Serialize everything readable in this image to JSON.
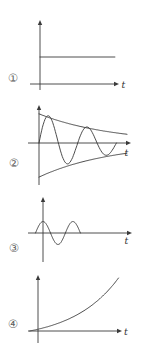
{
  "figure": {
    "background": "#ffffff",
    "stroke": "#3a3a3a",
    "number_color": "#5f5f5f",
    "panel_count": 4
  },
  "chart_data": [
    {
      "type": "line",
      "panel_label": "①",
      "xlabel": "t",
      "description": "constant steady value above the time axis",
      "x_range": [
        0,
        1
      ],
      "y_range": [
        -1.3,
        1.3
      ],
      "grid": false,
      "series": [
        {
          "name": "constant",
          "form": "points",
          "points": [
            [
              0,
              0.964
            ],
            [
              0.96,
              0.964
            ]
          ]
        }
      ]
    },
    {
      "type": "line",
      "panel_label": "②",
      "xlabel": "t",
      "description": "damped oscillation bounded by exponential decay envelopes",
      "x_range": [
        0,
        1
      ],
      "y_range": [
        -1.3,
        1.3
      ],
      "grid": false,
      "series": [
        {
          "name": "damped-sine",
          "form": "damped_sine",
          "amplitude": 1.0,
          "tau": 0.83,
          "period": 0.44,
          "t_start": 0,
          "t_end": 0.88
        },
        {
          "name": "upper-envelope",
          "form": "exp_decay",
          "amplitude": 0.94,
          "tau": 0.83,
          "t_start": 0,
          "t_end": 1.0
        },
        {
          "name": "lower-envelope",
          "form": "exp_decay",
          "amplitude": -1.1,
          "tau": 0.83,
          "t_start": 0,
          "t_end": 1.0
        }
      ]
    },
    {
      "type": "line",
      "panel_label": "③",
      "xlabel": "t",
      "description": "short constant-amplitude sine burst that stops",
      "x_range": [
        0,
        1
      ],
      "y_range": [
        -1.3,
        1.3
      ],
      "grid": false,
      "series": [
        {
          "name": "sine-burst",
          "form": "sine",
          "amplitude": 1.0,
          "period": 0.34,
          "t_start": -0.085,
          "t_end": 0.425
        }
      ]
    },
    {
      "type": "line",
      "panel_label": "④",
      "xlabel": "t",
      "description": "exponentially growing curve from the origin",
      "x_range": [
        0,
        1
      ],
      "y_range": [
        0,
        1.2
      ],
      "grid": false,
      "series": [
        {
          "name": "exponential",
          "form": "exp_growth",
          "amplitude": 1.0,
          "k": 1.8,
          "t_start": -0.1,
          "t_end": 0.97
        }
      ]
    }
  ]
}
